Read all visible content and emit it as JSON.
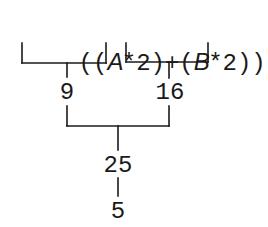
{
  "diagram": {
    "expression": {
      "tokens": [
        "(",
        "(",
        "A",
        "*",
        "2",
        ")",
        "+",
        "(",
        "B",
        "*",
        "2",
        ")",
        ")",
        "*",
        ".",
        "5"
      ],
      "variables": [
        "A",
        "B"
      ],
      "full_text": "((A*2)+(B*2))*.5"
    },
    "nodes": {
      "left_subexpr_value": "9",
      "right_subexpr_value": "16",
      "sum_value": "25",
      "final_value": "5"
    },
    "tree": {
      "root": "5",
      "children": [
        {
          "value": "25",
          "operation": "*.5",
          "children": [
            {
              "value": "9",
              "source": "(A*2)"
            },
            {
              "value": "16",
              "source": "(B*2)"
            }
          ]
        }
      ]
    },
    "colors": {
      "ink": "#1a1a1a",
      "background": "#ffffff"
    }
  }
}
